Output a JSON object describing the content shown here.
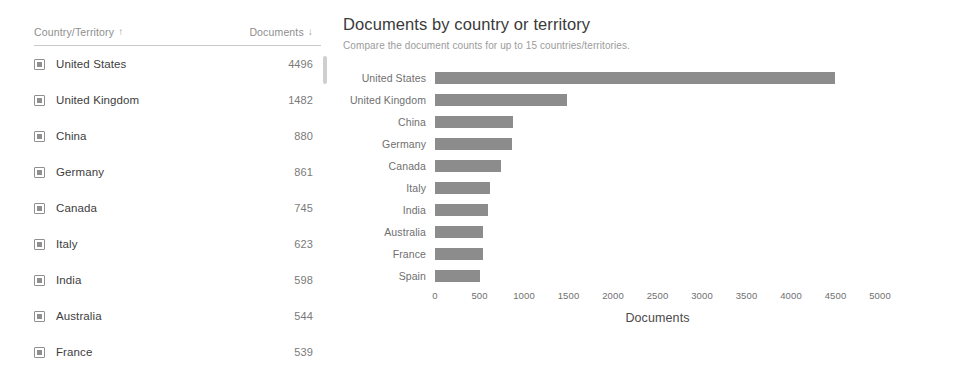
{
  "table": {
    "columns": [
      {
        "label": "Country/Territory",
        "sort_icon": "arrow-up",
        "sort_glyph": "↑"
      },
      {
        "label": "Documents",
        "sort_icon": "arrow-down",
        "sort_glyph": "↓"
      }
    ],
    "rows": [
      {
        "name": "United States",
        "value": "4496"
      },
      {
        "name": "United Kingdom",
        "value": "1482"
      },
      {
        "name": "China",
        "value": "880"
      },
      {
        "name": "Germany",
        "value": "861"
      },
      {
        "name": "Canada",
        "value": "745"
      },
      {
        "name": "Italy",
        "value": "623"
      },
      {
        "name": "India",
        "value": "598"
      },
      {
        "name": "Australia",
        "value": "544"
      },
      {
        "name": "France",
        "value": "539"
      }
    ],
    "row_icon": "document-square-icon",
    "scrollbar": "vertical-scrollbar"
  },
  "chart_data": {
    "type": "bar",
    "orientation": "horizontal",
    "title": "Documents by country or territory",
    "subtitle": "Compare the document counts for up to 15 countries/territories.",
    "categories": [
      "United States",
      "United Kingdom",
      "China",
      "Germany",
      "Canada",
      "Italy",
      "India",
      "Australia",
      "France",
      "Spain"
    ],
    "values": [
      4496,
      1482,
      880,
      861,
      745,
      623,
      598,
      544,
      539,
      500
    ],
    "xlabel": "Documents",
    "ylabel": "",
    "xlim": [
      0,
      5000
    ],
    "xticks": [
      0,
      500,
      1000,
      1500,
      2000,
      2500,
      3000,
      3500,
      4000,
      4500,
      5000
    ],
    "xtick_labels": [
      "0",
      "500",
      "1000",
      "1500",
      "2000",
      "2500",
      "3000",
      "3500",
      "4000",
      "4500",
      "5000"
    ],
    "grid": false,
    "legend": null,
    "bar_color": "#8c8c8c"
  },
  "colors": {
    "background": "#ffffff",
    "text_primary": "#3b3b3b",
    "text_muted": "#8e8e8e",
    "bar": "#8c8c8c",
    "rule": "#c9c9c9"
  }
}
